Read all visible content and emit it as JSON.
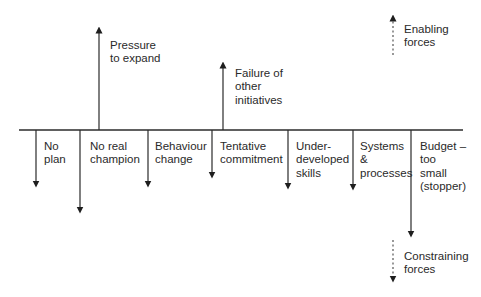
{
  "diagram": {
    "type": "force-field-analysis",
    "colors": {
      "line": "#2b2b2b",
      "text": "#2a2a2a",
      "background": "#ffffff"
    },
    "baseline": {
      "x1": 19,
      "x2": 463,
      "y": 130
    },
    "enabling_forces": [
      {
        "id": "pressure",
        "label": "Pressure\nto expand",
        "x": 99,
        "top": 27
      },
      {
        "id": "failure",
        "label": "Failure of\nother\ninitiatives",
        "x": 223,
        "top": 62
      }
    ],
    "constraining_forces": [
      {
        "id": "no-plan",
        "label": "No\nplan",
        "x": 36,
        "bottom": 187
      },
      {
        "id": "no-champion",
        "label": "No real\nchampion",
        "x": 80,
        "bottom": 213
      },
      {
        "id": "behaviour",
        "label": "Behaviour\nchange",
        "x": 148,
        "bottom": 187
      },
      {
        "id": "tentative",
        "label": "Tentative\ncommitment",
        "x": 212,
        "bottom": 178
      },
      {
        "id": "skills",
        "label": "Under-\ndeveloped\nskills",
        "x": 288,
        "bottom": 189
      },
      {
        "id": "systems",
        "label": "Systems\n&\nprocesses",
        "x": 353,
        "bottom": 190
      },
      {
        "id": "budget",
        "label": "Budget –\ntoo\nsmall\n(stopper)",
        "x": 411,
        "bottom": 237
      }
    ],
    "legend": {
      "enabling": {
        "label": "Enabling\nforces",
        "style": "dotted-up-arrow"
      },
      "constraining": {
        "label": "Constraining\nforces",
        "style": "dotted-down-arrow"
      }
    }
  }
}
